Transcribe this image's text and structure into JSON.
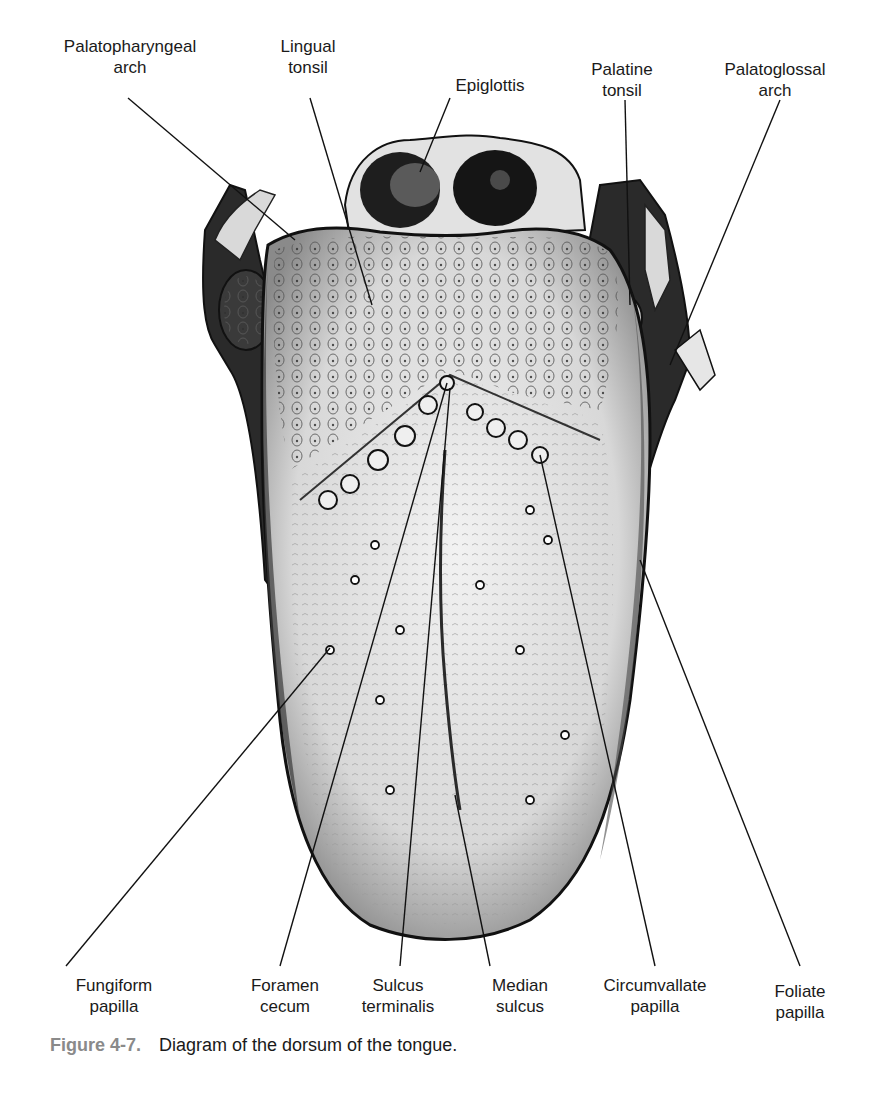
{
  "figure": {
    "number": "Figure 4-7.",
    "caption": "Diagram of the dorsum of the tongue.",
    "subject": "Dorsum of the tongue"
  },
  "labels_top": [
    {
      "id": "palatopharyngeal-arch",
      "line1": "Palatopharyngeal",
      "line2": "arch",
      "x": 130,
      "y": 60
    },
    {
      "id": "lingual-tonsil",
      "line1": "Lingual",
      "line2": "tonsil",
      "x": 308,
      "y": 60
    },
    {
      "id": "epiglottis",
      "line1": "Epiglottis",
      "line2": "",
      "x": 490,
      "y": 76
    },
    {
      "id": "palatine-tonsil",
      "line1": "Palatine",
      "line2": "tonsil",
      "x": 622,
      "y": 62
    },
    {
      "id": "palatoglossal-arch",
      "line1": "Palatoglossal",
      "line2": "arch",
      "x": 775,
      "y": 62
    }
  ],
  "labels_bottom": [
    {
      "id": "fungiform-papilla",
      "line1": "Fungiform",
      "line2": "papilla",
      "x": 114,
      "y": 978
    },
    {
      "id": "foramen-cecum",
      "line1": "Foramen",
      "line2": "cecum",
      "x": 285,
      "y": 978
    },
    {
      "id": "sulcus-terminalis",
      "line1": "Sulcus",
      "line2": "terminalis",
      "x": 398,
      "y": 978
    },
    {
      "id": "median-sulcus",
      "line1": "Median",
      "line2": "sulcus",
      "x": 520,
      "y": 978
    },
    {
      "id": "circumvallate-papilla",
      "line1": "Circumvallate",
      "line2": "papilla",
      "x": 655,
      "y": 978
    },
    {
      "id": "foliate-papilla",
      "line1": "Foliate",
      "line2": "papilla",
      "x": 800,
      "y": 982
    }
  ]
}
